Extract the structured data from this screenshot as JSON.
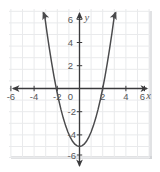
{
  "figure": {
    "kind": "coordinate-grid-parabola",
    "background_color": "#ffffff",
    "grid_color": "#e9eaec",
    "grid_border_color": "#d8d9dc",
    "axis_color": "#3a3a3c",
    "curve_color": "#4a4a4c",
    "label_color": "#58585a"
  },
  "axes": {
    "x_axis_label": "x",
    "y_axis_label": "y",
    "x_ticks": [
      "-6",
      "-4",
      "-2",
      "0",
      "2",
      "4",
      "6"
    ],
    "x_tick_values": [
      -6,
      -4,
      -2,
      0,
      2,
      4,
      6
    ],
    "y_ticks_positive": [
      "2",
      "4",
      "6"
    ],
    "y_ticks_negative": [
      "-2",
      "-4",
      "-6"
    ],
    "y_tick_values": [
      -6,
      -4,
      -2,
      2,
      4,
      6
    ],
    "origin_label": "0",
    "xlim": [
      -6.8,
      6.8
    ],
    "ylim": [
      -6.8,
      6.8
    ],
    "grid": true,
    "grid_step": 1,
    "arrows": [
      "x-left",
      "x-right",
      "y-up",
      "y-down"
    ]
  },
  "chart_data": {
    "type": "line",
    "title": "",
    "xlabel": "x",
    "ylabel": "y",
    "xlim": [
      -6.8,
      6.8
    ],
    "ylim": [
      -6.8,
      6.8
    ],
    "grid": true,
    "legend": "none",
    "series": [
      {
        "name": "parabola",
        "equation": "y = 1.25x^2 - 5",
        "vertex": [
          0,
          -5
        ],
        "x_intercepts": [
          -2,
          2
        ],
        "y_intercept": -5,
        "opens": "up",
        "x": [
          -3.03,
          -2.8,
          -2.6,
          -2.4,
          -2.2,
          -2.0,
          -1.8,
          -1.6,
          -1.4,
          -1.2,
          -1.0,
          -0.8,
          -0.6,
          -0.4,
          -0.2,
          0,
          0.2,
          0.4,
          0.6,
          0.8,
          1.0,
          1.2,
          1.4,
          1.6,
          1.8,
          2.0,
          2.2,
          2.4,
          2.6,
          2.8,
          3.03
        ],
        "values": [
          6.48,
          4.8,
          3.45,
          2.2,
          1.05,
          0.0,
          -0.95,
          -1.8,
          -2.55,
          -3.2,
          -3.75,
          -4.2,
          -4.55,
          -4.8,
          -4.95,
          -5.0,
          -4.95,
          -4.8,
          -4.55,
          -4.2,
          -3.75,
          -3.2,
          -2.55,
          -1.8,
          -0.95,
          0.0,
          1.05,
          2.2,
          3.45,
          4.8,
          6.48
        ],
        "arrow_ends": [
          "left-up",
          "right-up"
        ]
      }
    ]
  }
}
